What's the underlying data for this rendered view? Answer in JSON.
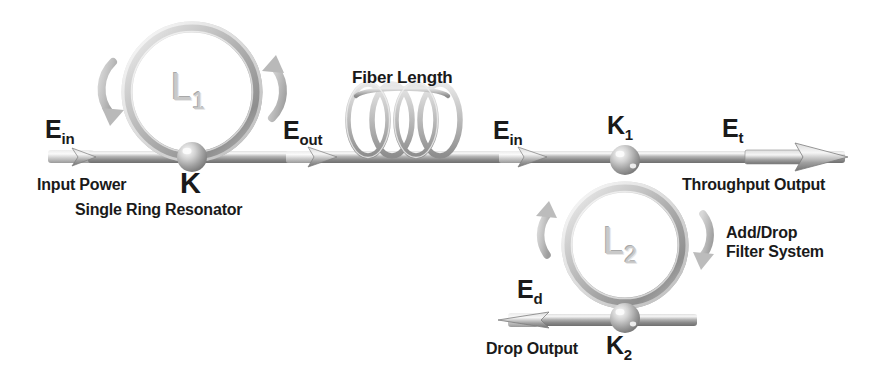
{
  "figure": {
    "type": "optical-schematic"
  },
  "palette": {
    "metal_light": "#e6e6e6",
    "metal_mid": "#b0b0b0",
    "metal_dark": "#808080",
    "metal_shadow": "#6e6e6e",
    "text": "#1a1a1a",
    "ring_label": "#c9c9c9",
    "background": "#ffffff"
  },
  "labels": {
    "e_in_left": {
      "symbol": "E",
      "sub": "in"
    },
    "input_power": "Input Power",
    "k_coupling": {
      "symbol": "K",
      "sub": ""
    },
    "single_ring_resonator": "Single Ring Resonator",
    "ring1": {
      "symbol": "L",
      "sub": "1"
    },
    "e_out": {
      "symbol": "E",
      "sub": "out"
    },
    "fiber_length": "Fiber Length",
    "e_in_right": {
      "symbol": "E",
      "sub": "in"
    },
    "k1_coupling": {
      "symbol": "K",
      "sub": "1"
    },
    "e_t": {
      "symbol": "E",
      "sub": "t"
    },
    "throughput_output": "Throughput Output",
    "ring2": {
      "symbol": "L",
      "sub": "2"
    },
    "add_drop_line1": "Add/Drop",
    "add_drop_line2": "Filter System",
    "e_d": {
      "symbol": "E",
      "sub": "d"
    },
    "drop_output": "Drop Output",
    "k2_coupling": {
      "symbol": "K",
      "sub": "2"
    }
  },
  "components": {
    "ring1": {
      "cx": 192,
      "cy": 92,
      "r": 65,
      "label": "L1"
    },
    "ring2": {
      "cx": 625,
      "cy": 245,
      "r": 58,
      "label": "L2"
    },
    "top_waveguide": {
      "y": 157,
      "x_start": 48,
      "x_end": 845
    },
    "bottom_waveguide": {
      "y": 320,
      "x_start": 500,
      "x_end": 697
    },
    "fiber_coil": {
      "cx": 405,
      "cy": 118,
      "loops": 4
    },
    "coupling_nodes": [
      {
        "name": "K",
        "x": 192,
        "y": 157
      },
      {
        "name": "K1",
        "x": 625,
        "y": 157
      },
      {
        "name": "K2",
        "x": 625,
        "y": 320
      }
    ],
    "arrow_markers": [
      {
        "name": "input-arrow",
        "x": 90,
        "dir": "right"
      },
      {
        "name": "e-out-arrow",
        "x": 330,
        "dir": "right"
      },
      {
        "name": "e-in-arrow",
        "x": 540,
        "dir": "right"
      },
      {
        "name": "e-t-arrow",
        "x": 845,
        "dir": "right"
      },
      {
        "name": "e-d-arrow",
        "x": 500,
        "dir": "left"
      }
    ],
    "circulation_arrows": [
      {
        "name": "ring1-left",
        "dir": "down"
      },
      {
        "name": "ring1-right",
        "dir": "up"
      },
      {
        "name": "ring2-left",
        "dir": "up"
      },
      {
        "name": "ring2-right",
        "dir": "down"
      }
    ]
  }
}
